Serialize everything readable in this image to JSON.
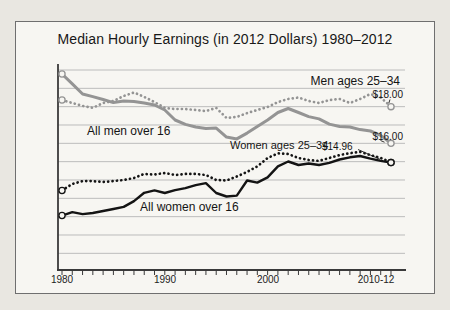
{
  "page": {
    "background": "#e9e7e1",
    "card_background": "#f7f6f2",
    "frame_color": "#6f6f6f",
    "gridline_color": "#bcbcbc",
    "axis_color": "#3a3a3a",
    "gray_series_color": "#949494",
    "black_series_color": "#141414"
  },
  "chart": {
    "title": "Median Hourly Earnings (in 2012 Dollars) 1980–2012",
    "annotations": {
      "men_25_34": {
        "label": "Men ages 25–34",
        "value": "$18.00"
      },
      "all_men": {
        "label": "All men over 16",
        "value": "$16.00"
      },
      "women_25_34": {
        "label": "Women ages 25–34",
        "value": "$14.96"
      },
      "all_women": {
        "label": "All women over 16"
      }
    }
  },
  "chart_data": {
    "type": "line",
    "title": "Median Hourly Earnings (in 2012 Dollars) 1980–2012",
    "xlabel": "",
    "ylabel": "",
    "x": [
      1980,
      1981,
      1982,
      1983,
      1984,
      1985,
      1986,
      1987,
      1988,
      1989,
      1990,
      1991,
      1992,
      1993,
      1994,
      1995,
      1996,
      1997,
      1998,
      1999,
      2000,
      2001,
      2002,
      2003,
      2004,
      2005,
      2006,
      2007,
      2008,
      2009,
      2010,
      2011,
      2012
    ],
    "x_tick_labels": [
      "1980",
      "1990",
      "2000",
      "2010-12"
    ],
    "ylim": [
      9.1,
      20.2
    ],
    "y_gridlines": [
      10,
      11,
      12,
      13,
      14,
      15,
      16,
      17,
      18,
      19,
      20
    ],
    "grid": "horizontal only, unlabeled $1 intervals",
    "legend_position": "inline labels on chart",
    "series": [
      {
        "name": "Men ages 25–34",
        "style": "dotted",
        "color": "#949494",
        "end_label": "$18.00",
        "values": [
          18.36,
          18.2,
          18.04,
          17.93,
          18.2,
          18.31,
          18.58,
          18.77,
          18.53,
          18.25,
          17.93,
          17.87,
          17.87,
          17.82,
          17.76,
          17.93,
          17.38,
          17.44,
          17.65,
          17.82,
          17.98,
          18.25,
          18.42,
          18.5,
          18.31,
          18.2,
          18.36,
          18.42,
          18.2,
          18.42,
          18.69,
          18.5,
          18.0
        ]
      },
      {
        "name": "All men over 16",
        "style": "solid",
        "color": "#949494",
        "end_label": "$16.00",
        "values": [
          19.78,
          19.24,
          18.69,
          18.55,
          18.39,
          18.22,
          18.31,
          18.28,
          18.2,
          18.09,
          17.82,
          17.27,
          17.03,
          16.89,
          16.81,
          16.83,
          16.34,
          16.24,
          16.56,
          16.92,
          17.27,
          17.68,
          17.9,
          17.68,
          17.46,
          17.33,
          17.05,
          16.92,
          16.89,
          16.75,
          16.67,
          16.43,
          16.0
        ]
      },
      {
        "name": "Women ages 25–34",
        "style": "dotted",
        "color": "#141414",
        "end_label": "$14.96",
        "values": [
          13.43,
          13.78,
          13.94,
          13.94,
          13.89,
          13.94,
          14.0,
          14.11,
          14.33,
          14.3,
          14.38,
          14.27,
          14.33,
          14.33,
          14.27,
          14.0,
          13.97,
          14.19,
          14.44,
          14.74,
          15.2,
          15.45,
          15.42,
          15.2,
          15.09,
          15.04,
          15.2,
          15.36,
          15.46,
          15.54,
          15.36,
          15.2,
          14.96
        ]
      },
      {
        "name": "All women over 16",
        "style": "solid",
        "color": "#141414",
        "end_label": "",
        "values": [
          12.06,
          12.25,
          12.14,
          12.2,
          12.31,
          12.42,
          12.53,
          12.85,
          13.3,
          13.43,
          13.29,
          13.45,
          13.56,
          13.72,
          13.83,
          13.29,
          13.1,
          13.15,
          13.97,
          13.86,
          14.14,
          14.74,
          15.01,
          14.82,
          14.9,
          14.82,
          14.93,
          15.12,
          15.24,
          15.31,
          15.16,
          15.04,
          14.95
        ]
      }
    ]
  }
}
